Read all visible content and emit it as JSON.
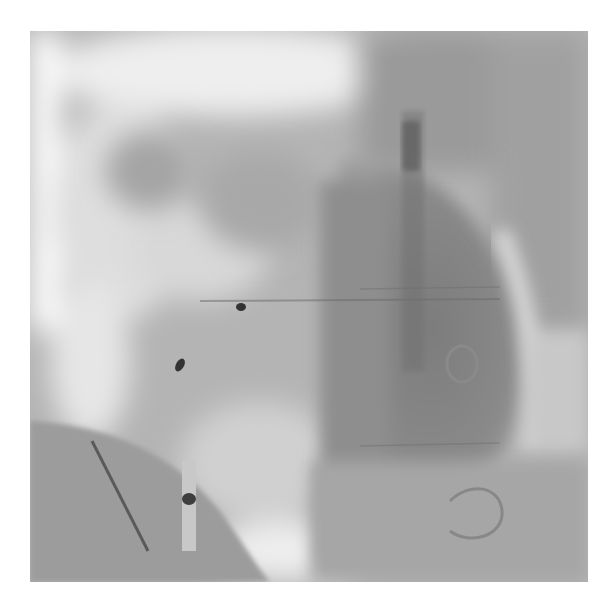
{
  "image": {
    "type": "fluoroscopy",
    "modality": "grayscale x-ray angiogram",
    "frame": {
      "x": 30,
      "y": 31,
      "width": 558,
      "height": 551
    },
    "colors": {
      "background": "#ffffff",
      "bright": "#f2f2f2",
      "mid": "#b0b0b0",
      "dark": "#7e7e7e",
      "marker": "#3a3a3a"
    },
    "features": [
      {
        "name": "cardiac-silhouette",
        "shape": "ellipse"
      },
      {
        "name": "diaphragm-shadow",
        "shape": "curved-region"
      },
      {
        "name": "catheter-wire",
        "shape": "line"
      },
      {
        "name": "electrode-marker",
        "shape": "dot"
      },
      {
        "name": "coil-loop",
        "shape": "ring"
      }
    ]
  }
}
